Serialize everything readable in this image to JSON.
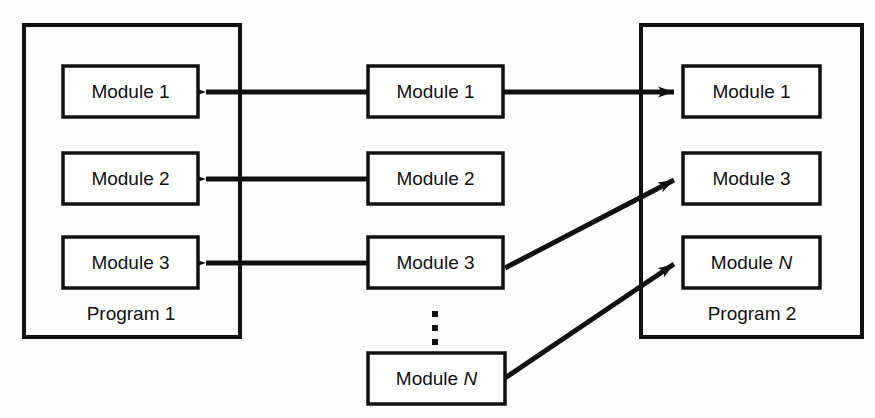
{
  "diagram": {
    "colors": {
      "stroke": "#111111",
      "box_fill": "#ffffff",
      "background": "#fdfdfd"
    },
    "left_program": {
      "label": "Program 1",
      "modules": [
        {
          "label": "Module 1"
        },
        {
          "label": "Module 2"
        },
        {
          "label": "Module 3"
        }
      ]
    },
    "library": {
      "modules": [
        {
          "label": "Module 1"
        },
        {
          "label": "Module 2"
        },
        {
          "label": "Module 3"
        },
        {
          "label_prefix": "Module ",
          "label_italic": "N"
        }
      ],
      "ellipsis": "⋮"
    },
    "right_program": {
      "label": "Program 2",
      "modules": [
        {
          "label": "Module 1"
        },
        {
          "label": "Module 3"
        },
        {
          "label_prefix": "Module ",
          "label_italic": "N"
        }
      ]
    },
    "connections": [
      {
        "from": "library-module-1",
        "to": "left-module-1",
        "direction": "left"
      },
      {
        "from": "library-module-2",
        "to": "left-module-2",
        "direction": "left"
      },
      {
        "from": "library-module-3",
        "to": "left-module-3",
        "direction": "left"
      },
      {
        "from": "library-module-1",
        "to": "right-module-1",
        "direction": "right"
      },
      {
        "from": "library-module-3",
        "to": "right-module-3",
        "direction": "right-diagonal"
      },
      {
        "from": "library-module-n",
        "to": "right-module-n",
        "direction": "right-diagonal"
      }
    ]
  }
}
